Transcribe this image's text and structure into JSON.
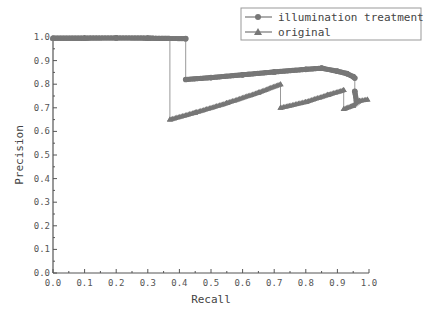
{
  "chart_data": {
    "type": "line",
    "title": "",
    "xlabel": "Recall",
    "ylabel": "Precision",
    "xlim": [
      0.0,
      1.0
    ],
    "ylim": [
      0.0,
      1.0
    ],
    "xticks": [
      "0.0",
      "0.1",
      "0.2",
      "0.3",
      "0.4",
      "0.5",
      "0.6",
      "0.7",
      "0.8",
      "0.9",
      "1.0"
    ],
    "yticks": [
      "0.0",
      "0.1",
      "0.2",
      "0.3",
      "0.4",
      "0.5",
      "0.6",
      "0.7",
      "0.8",
      "0.9",
      "1.0"
    ],
    "grid": false,
    "legend_position": "top-right",
    "series": [
      {
        "name": "illumination treatment",
        "marker": "circle",
        "color": "#777777",
        "points": [
          [
            0.0,
            0.995
          ],
          [
            0.1,
            0.995
          ],
          [
            0.2,
            0.996
          ],
          [
            0.3,
            0.995
          ],
          [
            0.42,
            0.993
          ],
          [
            0.42,
            0.82
          ],
          [
            0.5,
            0.828
          ],
          [
            0.6,
            0.84
          ],
          [
            0.7,
            0.852
          ],
          [
            0.8,
            0.863
          ],
          [
            0.85,
            0.868
          ],
          [
            0.9,
            0.855
          ],
          [
            0.93,
            0.845
          ],
          [
            0.95,
            0.832
          ],
          [
            0.955,
            0.826
          ],
          [
            0.955,
            0.77
          ],
          [
            0.96,
            0.73
          ]
        ]
      },
      {
        "name": "original",
        "marker": "triangle",
        "color": "#777777",
        "points": [
          [
            0.0,
            0.995
          ],
          [
            0.1,
            0.995
          ],
          [
            0.2,
            0.996
          ],
          [
            0.3,
            0.995
          ],
          [
            0.37,
            0.993
          ],
          [
            0.37,
            0.65
          ],
          [
            0.45,
            0.68
          ],
          [
            0.55,
            0.72
          ],
          [
            0.65,
            0.765
          ],
          [
            0.72,
            0.8
          ],
          [
            0.72,
            0.7
          ],
          [
            0.8,
            0.725
          ],
          [
            0.87,
            0.755
          ],
          [
            0.92,
            0.775
          ],
          [
            0.92,
            0.695
          ],
          [
            0.95,
            0.71
          ],
          [
            0.97,
            0.73
          ],
          [
            0.995,
            0.735
          ]
        ]
      }
    ]
  }
}
